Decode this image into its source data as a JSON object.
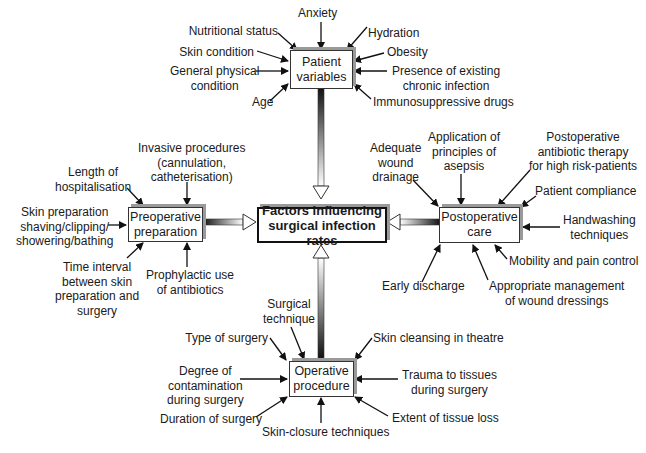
{
  "center": {
    "line1": "Factors influencing",
    "line2": "surgical infection rates"
  },
  "patient": {
    "title1": "Patient",
    "title2": "variables",
    "factors": {
      "nutritional": "Nutritional status",
      "anxiety": "Anxiety",
      "hydration": "Hydration",
      "skin": "Skin condition",
      "obesity": "Obesity",
      "general1": "General physical",
      "general2": "condition",
      "chronic1": "Presence of existing",
      "chronic2": "chronic infection",
      "age": "Age",
      "immuno": "Immunosuppressive drugs"
    }
  },
  "preop": {
    "title1": "Preoperative",
    "title2": "preparation",
    "factors": {
      "invasive1": "Invasive procedures",
      "invasive2": "(cannulation,",
      "invasive3": "catheterisation)",
      "length1": "Length of",
      "length2": "hospitalisation",
      "skinprep1": "Skin preparation",
      "skinprep2": "shaving/clipping/",
      "skinprep3": "showering/bathing",
      "time1": "Time interval",
      "time2": "between skin",
      "time3": "preparation and",
      "time4": "surgery",
      "prophy1": "Prophylactic use",
      "prophy2": "of antibiotics"
    }
  },
  "postop": {
    "title1": "Postoperative",
    "title2": "care",
    "factors": {
      "drainage1": "Adequate",
      "drainage2": "wound",
      "drainage3": "drainage",
      "asepsis1": "Application of",
      "asepsis2": "principles of",
      "asepsis3": "asepsis",
      "antib1": "Postoperative",
      "antib2": "antibiotic therapy",
      "antib3": "for high risk-patients",
      "compliance": "Patient compliance",
      "hand1": "Handwashing",
      "hand2": "techniques",
      "mobility": "Mobility and pain control",
      "early": "Early discharge",
      "dress1": "Appropriate management",
      "dress2": "of wound dressings"
    }
  },
  "operative": {
    "title1": "Operative",
    "title2": "procedure",
    "factors": {
      "technique1": "Surgical",
      "technique2": "technique",
      "type": "Type of surgery",
      "cleansing": "Skin cleansing in theatre",
      "degree1": "Degree of",
      "degree2": "contamination",
      "degree3": "during surgery",
      "trauma1": "Trauma to tissues",
      "trauma2": "during surgery",
      "duration": "Duration of surgery",
      "closure": "Skin-closure techniques",
      "extent": "Extent of tissue loss"
    }
  }
}
